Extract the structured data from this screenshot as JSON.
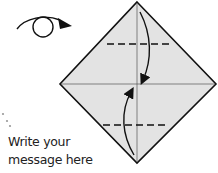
{
  "diagram": {
    "type": "origami-fold-instruction",
    "step_icon": "turn-over-icon",
    "message_line1": "Write your",
    "message_line2": "message here",
    "colors": {
      "paper_fill": "#e3e3e3",
      "outline": "#111111",
      "background": "#ffffff"
    },
    "folds": [
      {
        "type": "valley-fold",
        "position": "upper",
        "direction": "down"
      },
      {
        "type": "valley-fold",
        "position": "lower",
        "direction": "up"
      }
    ]
  }
}
